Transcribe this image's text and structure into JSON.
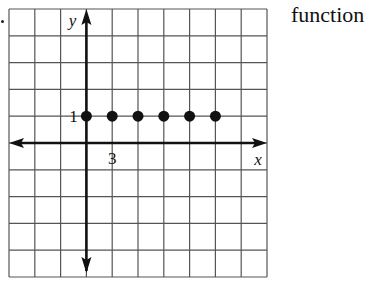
{
  "caption": "function",
  "colors": {
    "grid": "#555555",
    "axis": "#111111",
    "point": "#111111",
    "background": "#ffffff"
  },
  "chart_data": {
    "type": "scatter",
    "title": "",
    "xlabel": "x",
    "ylabel": "y",
    "tick_labels": {
      "x": [
        "3"
      ],
      "y": [
        "1"
      ]
    },
    "x_step_per_grid": 3,
    "y_step_per_grid": 1,
    "grid": true,
    "grid_cols": 10,
    "grid_rows": 10,
    "xlim": [
      -9,
      21
    ],
    "ylim": [
      -5,
      5
    ],
    "series": [
      {
        "name": "points",
        "marker": "filled-circle",
        "x": [
          0,
          3,
          6,
          9,
          12,
          15
        ],
        "y": [
          1,
          1,
          1,
          1,
          1,
          1
        ]
      }
    ],
    "axes_arrows": {
      "x": "both",
      "y": "both"
    }
  }
}
